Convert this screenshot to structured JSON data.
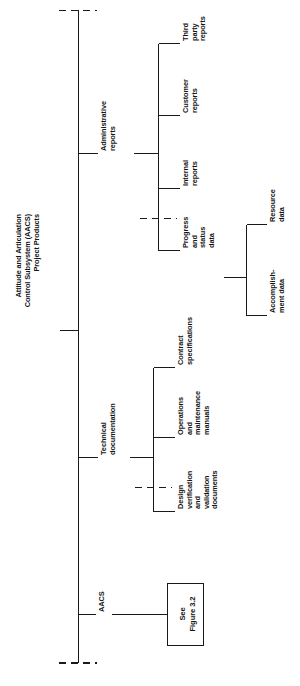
{
  "figure": {
    "title_lines": [
      "Attitude and Articulation",
      "Control Subsystem (AACS)",
      "Project Products"
    ],
    "orientation": "rotated-90-ccw",
    "line_color": "#1a1a1a",
    "background": "#ffffff"
  },
  "root": {
    "label": "Attitude and Articulation Control Subsystem (AACS) Project Products"
  },
  "branches": {
    "aacs": {
      "label": "AACS",
      "box": {
        "lines": [
          "See",
          "Figure 3.2"
        ],
        "text": "See Figure 3.2"
      }
    },
    "technical": {
      "label_lines": [
        "Technical",
        "documentation"
      ],
      "label": "Technical documentation",
      "children": [
        {
          "label_lines": [
            "Contract",
            "specifications"
          ],
          "label": "Contract specifications"
        },
        {
          "label_lines": [
            "Operations",
            "and",
            "maintenance",
            "manuals"
          ],
          "label": "Operations and maintenance manuals"
        },
        {
          "label_lines": [
            "Design",
            "verification",
            "and",
            "validation",
            "documents"
          ],
          "label": "Design verification and validation documents"
        }
      ]
    },
    "administrative": {
      "label_lines": [
        "Administrative",
        "reports"
      ],
      "label": "Administrative reports",
      "children": [
        {
          "label_lines": [
            "Third",
            "party",
            "reports"
          ],
          "label": "Third party reports"
        },
        {
          "label_lines": [
            "Customer",
            "reports"
          ],
          "label": "Customer reports"
        },
        {
          "label_lines": [
            "Internal",
            "reports"
          ],
          "label": "Internal reports"
        },
        {
          "label_lines": [
            "Progress",
            "and",
            "status",
            "data"
          ],
          "label": "Progress and status data",
          "children": [
            {
              "label_lines": [
                "Resource",
                "data"
              ],
              "label": "Resource data"
            },
            {
              "label_lines": [
                "Accomplish-",
                "ment data"
              ],
              "label": "Accomplishment data"
            }
          ]
        }
      ]
    }
  }
}
